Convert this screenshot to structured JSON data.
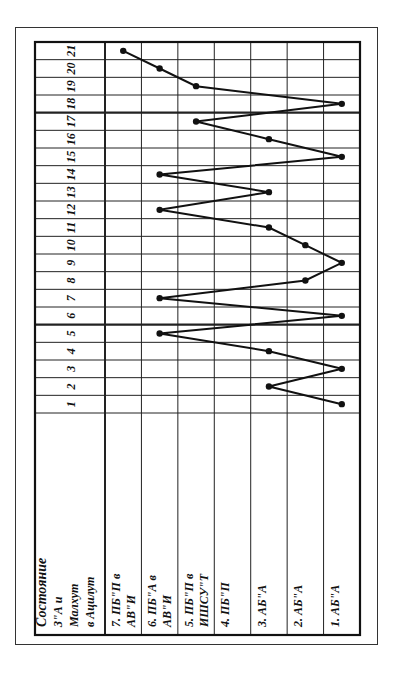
{
  "chart_data": {
    "type": "line",
    "orientation": "rotated-90-ccw",
    "title": "",
    "header_label": [
      "Состояние",
      "З\"А и",
      "Малхут",
      "в Ацилут"
    ],
    "xlabel": "",
    "ylabel": "Состояние З\"А и Малхут в Ацилут",
    "x": [
      1,
      2,
      3,
      4,
      5,
      6,
      7,
      8,
      9,
      10,
      11,
      12,
      13,
      14,
      15,
      16,
      17,
      18,
      19,
      20,
      21
    ],
    "states": [
      {
        "level": 7,
        "label_lines": [
          "7. ПБ\"П в",
          "АВ\"И"
        ]
      },
      {
        "level": 6,
        "label_lines": [
          "6. ПБ\"А в",
          "АВ\"И"
        ]
      },
      {
        "level": 5,
        "label_lines": [
          "5. ПБ\"П в",
          "ИШСУ\"Т"
        ]
      },
      {
        "level": 4,
        "label_lines": [
          "4. ПБ\"П"
        ]
      },
      {
        "level": 3,
        "label_lines": [
          "3. АБ\"А"
        ]
      },
      {
        "level": 2,
        "label_lines": [
          "2. АБ\"А"
        ]
      },
      {
        "level": 1,
        "label_lines": [
          "1. АБ\"А"
        ]
      }
    ],
    "series": [
      {
        "name": "state",
        "values": [
          1,
          3,
          1,
          3,
          6,
          1,
          6,
          2,
          1,
          2,
          3,
          6,
          3,
          6,
          1,
          3,
          5,
          1,
          5,
          6,
          7
        ]
      }
    ],
    "ylim": [
      1,
      7
    ],
    "grid": true,
    "thick_dividers_after_columns": [
      5,
      17
    ],
    "legend": null
  }
}
